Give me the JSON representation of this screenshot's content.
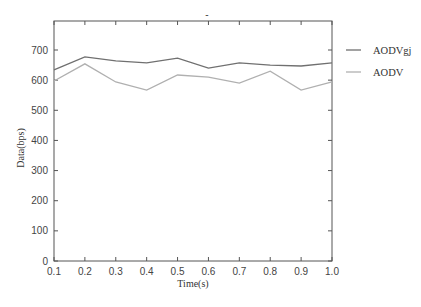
{
  "chart_data": {
    "type": "line",
    "title": "",
    "title_artifact": "-",
    "xlabel": "Time(s)",
    "ylabel": "Data(bps)",
    "x": [
      0.1,
      0.2,
      0.3,
      0.4,
      0.5,
      0.6,
      0.7,
      0.8,
      0.9,
      1.0
    ],
    "x_tick_labels": [
      "0.1",
      "0.2",
      "0.3",
      "0.4",
      "0.5",
      "0.6",
      "0.7",
      "0.8",
      "0.9",
      "1.0"
    ],
    "y_ticks": [
      0,
      100,
      200,
      300,
      400,
      500,
      600,
      700
    ],
    "y_tick_labels": [
      "0",
      "100",
      "200",
      "300",
      "400",
      "500",
      "600",
      "700"
    ],
    "xlim": [
      0.1,
      1.0
    ],
    "ylim": [
      0,
      795
    ],
    "grid": false,
    "legend_position": "outside-right-top",
    "series": [
      {
        "name": "AODVgj",
        "color": "#707070",
        "values": [
          634,
          677,
          664,
          657,
          673,
          640,
          657,
          650,
          647,
          657
        ]
      },
      {
        "name": "AODV",
        "color": "#b0b0b0",
        "values": [
          597,
          654,
          594,
          567,
          617,
          610,
          590,
          630,
          567,
          594
        ]
      }
    ]
  }
}
